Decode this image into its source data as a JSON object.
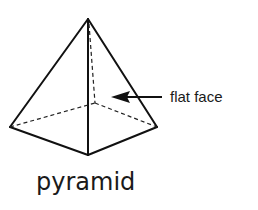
{
  "diagram": {
    "shape_name": "pyramid",
    "callout_label": "flat face",
    "colors": {
      "line": "#111111",
      "background": "#ffffff"
    },
    "vertices": {
      "apex": [
        88,
        19
      ],
      "base_left": [
        10,
        127
      ],
      "base_front": [
        88,
        155
      ],
      "base_right": [
        157,
        127
      ],
      "base_back_hidden": [
        95,
        103
      ]
    },
    "arrow": {
      "from": [
        162,
        97
      ],
      "to": [
        111,
        97
      ]
    }
  }
}
